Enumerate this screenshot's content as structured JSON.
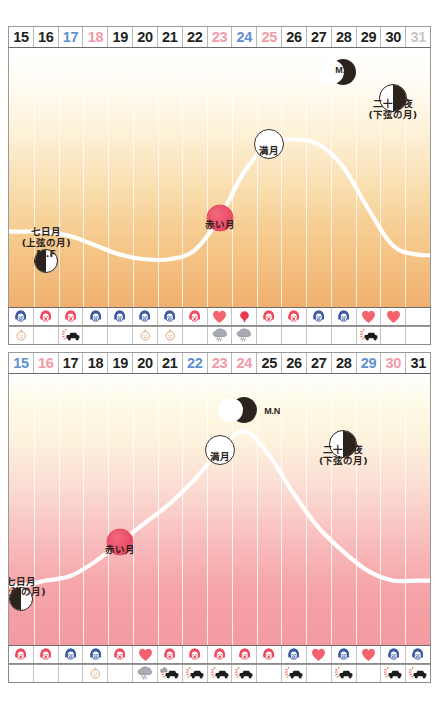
{
  "chart_data": [
    {
      "type": "line",
      "title": "",
      "chart_id": "moon-cycle-chart-upper",
      "palette": {
        "fill_top": "#ffffff",
        "fill_bottom": "#f0b070",
        "curve": "#ffffff",
        "red_moon": "#ea4f68"
      },
      "categories": [
        "15",
        "16",
        "17",
        "18",
        "19",
        "20",
        "21",
        "22",
        "23",
        "24",
        "25",
        "26",
        "27",
        "28",
        "29",
        "30",
        "31"
      ],
      "day_colors": [
        "black",
        "black",
        "blue",
        "pink",
        "black",
        "black",
        "black",
        "black",
        "pink",
        "blue",
        "pink",
        "black",
        "black",
        "black",
        "black",
        "black",
        "gray"
      ],
      "x": [
        15,
        16,
        17,
        18,
        19,
        20,
        21,
        22,
        23,
        24,
        25,
        26,
        27,
        28,
        29,
        30,
        31
      ],
      "values": [
        36,
        36,
        34,
        30,
        26,
        24,
        24,
        28,
        42,
        62,
        74,
        76,
        74,
        64,
        46,
        30,
        26
      ],
      "ylabel": "",
      "xlabel": "",
      "grid": true,
      "annotations": [
        {
          "name": "seventh-day-moon",
          "label": "七日月",
          "sublabel": "(上弦の月)",
          "code": "M.F",
          "phase": "half-left-dark",
          "day": 16
        },
        {
          "name": "red-moon",
          "label": "赤い月",
          "phase": "red-disc",
          "day": 23
        },
        {
          "name": "full-moon",
          "label": "満月",
          "phase": "full",
          "day": 25
        },
        {
          "name": "moon-night",
          "label": "M.N",
          "phase": "crescent",
          "day": 28
        },
        {
          "name": "twenty-third-night-moon",
          "label": "二十三夜",
          "sublabel": "(下弦の月)",
          "phase": "half-right-dark",
          "day": 30
        }
      ],
      "icon_row_1": [
        "face-blue-sad",
        "face-red-happy",
        "face-red-happy",
        "face-blue-sad",
        "face-blue-sad",
        "face-blue-sad",
        "face-blue-sad",
        "face-red-happy",
        "heart",
        "balloon",
        "face-red-happy",
        "face-red-happy",
        "face-blue-sad",
        "face-blue-sad",
        "heart",
        "heart",
        ""
      ],
      "icon_row_2": [
        "baby",
        "",
        "car",
        "",
        "",
        "baby",
        "baby",
        "",
        "cloud",
        "cloud",
        "",
        "",
        "",
        "",
        "car",
        "",
        ""
      ]
    },
    {
      "type": "line",
      "title": "",
      "chart_id": "moon-cycle-chart-lower",
      "palette": {
        "fill_top": "#ffffff",
        "fill_bottom": "#f49ba2",
        "curve": "#ffffff",
        "red_moon": "#ea4f68"
      },
      "categories": [
        "15",
        "16",
        "17",
        "18",
        "19",
        "20",
        "21",
        "22",
        "23",
        "24",
        "25",
        "26",
        "27",
        "28",
        "29",
        "30",
        "31"
      ],
      "day_colors": [
        "blue",
        "pink",
        "black",
        "black",
        "black",
        "black",
        "black",
        "blue",
        "pink",
        "pink",
        "black",
        "black",
        "black",
        "black",
        "blue",
        "pink",
        "black"
      ],
      "x": [
        15,
        16,
        17,
        18,
        19,
        20,
        21,
        22,
        23,
        24,
        25,
        26,
        27,
        28,
        29,
        30,
        31
      ],
      "values": [
        28,
        30,
        32,
        38,
        46,
        54,
        62,
        72,
        84,
        92,
        82,
        66,
        52,
        42,
        34,
        30,
        30
      ],
      "ylabel": "",
      "xlabel": "",
      "grid": true,
      "annotations": [
        {
          "name": "seventh-day-moon",
          "label": "七日月",
          "sublabel": "(上弦の月)",
          "phase": "half-left-dark",
          "day": 15
        },
        {
          "name": "red-moon",
          "label": "赤い月",
          "phase": "red-disc",
          "day": 19
        },
        {
          "name": "full-moon",
          "label": "満月",
          "phase": "full",
          "day": 23
        },
        {
          "name": "moon-night",
          "label": "M.N",
          "phase": "crescent-right",
          "day": 24
        },
        {
          "name": "twenty-third-night-moon",
          "label": "二十三夜",
          "sublabel": "(下弦の月)",
          "phase": "half-right-dark",
          "day": 28
        }
      ],
      "icon_row_1": [
        "face-red-happy",
        "face-red-happy",
        "face-blue-sad",
        "face-blue-sad",
        "face-red-happy",
        "heart",
        "face-red-happy",
        "face-red-happy",
        "face-red-happy",
        "face-red-happy",
        "face-red-happy",
        "face-blue-sad",
        "heart",
        "face-blue-sad",
        "heart",
        "face-blue-sad",
        "face-blue-sad"
      ],
      "icon_row_2": [
        "",
        "",
        "",
        "baby",
        "",
        "cloud",
        "cloud-car",
        "car",
        "car",
        "car",
        "",
        "car",
        "",
        "car",
        "",
        "car",
        "car"
      ]
    }
  ]
}
